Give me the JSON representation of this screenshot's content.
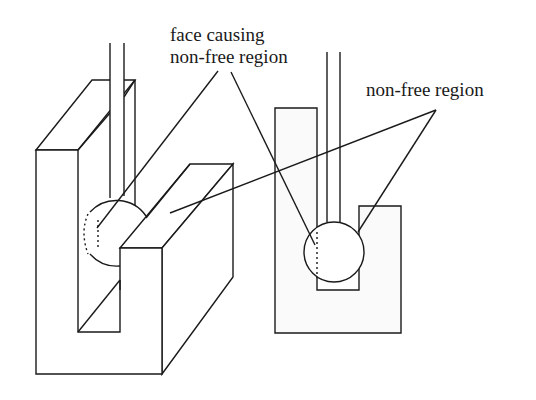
{
  "figure": {
    "labels": {
      "face_causing_line1": "face causing",
      "face_causing_line2": "non-free region",
      "non_free_region": "non-free region"
    },
    "views": [
      {
        "name": "3d-view",
        "description": "U-shaped block with vertical shaft and ball in slot"
      },
      {
        "name": "2d-side-view",
        "description": "Side view of U-slot with ball and shaft"
      }
    ],
    "colors": {
      "line": "#1a1a1a",
      "background": "#ffffff"
    }
  }
}
